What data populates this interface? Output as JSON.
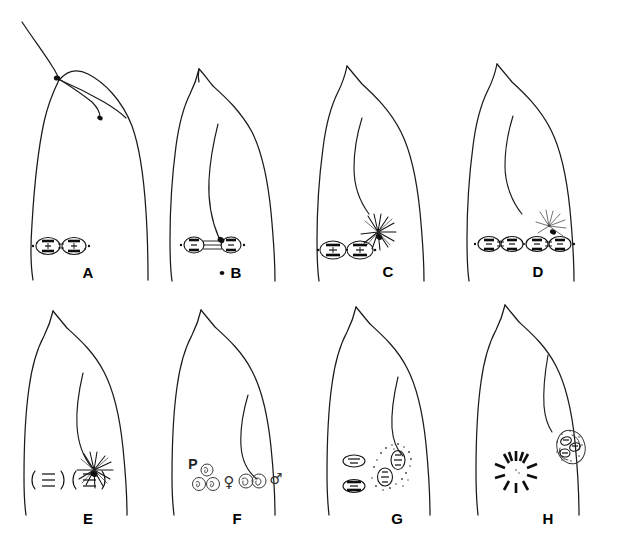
{
  "figure": {
    "background_color": "#ffffff",
    "ink_color": "#111111",
    "width": 639,
    "height": 544,
    "rows": 2,
    "columns": 4
  },
  "panels": [
    {
      "id": "A",
      "label": "A",
      "label_x": 88,
      "label_y": 278,
      "row": 1,
      "column": 1,
      "description": "Egg with fertilization cone at apex; sperm entry point marked by dark spot with sperm tail trailing to the right; metaphase spindle with chromosomes at the base.",
      "features": [
        "fertilization-cone",
        "sperm-entry-spot",
        "sperm-tail",
        "metaphase-spindle"
      ],
      "aster_count": 0,
      "spindle_count": 1
    },
    {
      "id": "B",
      "label": "B",
      "label_x": 236,
      "label_y": 278,
      "row": 1,
      "column": 2,
      "description": "Egg with smooth apex; sperm tail curving down inside cytoplasm ending in dark sperm head; anaphase spindle with separated chromosomes joined by fibers.",
      "features": [
        "apex-cone",
        "sperm-tail",
        "sperm-head",
        "anaphase-spindle"
      ],
      "aster_count": 0,
      "spindle_count": 1,
      "marker_dot": true
    },
    {
      "id": "C",
      "label": "C",
      "label_x": 388,
      "label_y": 277,
      "row": 1,
      "column": 3,
      "description": "Egg with sperm tail; sperm aster (radiating rays around dark sperm nucleus) near lower right; two daughter spindles abutting at the base.",
      "features": [
        "sperm-tail",
        "sperm-aster",
        "paired-spindles"
      ],
      "aster_count": 1,
      "spindle_count": 2
    },
    {
      "id": "D",
      "label": "D",
      "label_x": 538,
      "label_y": 277,
      "row": 1,
      "column": 4,
      "description": "Egg with sperm tail; small sperm aster at right; four chromosome groups in two adjacent spindles along the base.",
      "features": [
        "sperm-tail",
        "sperm-aster",
        "four-group-spindles"
      ],
      "aster_count": 1,
      "spindle_count": 2
    },
    {
      "id": "E",
      "label": "E",
      "label_x": 88,
      "label_y": 524,
      "row": 2,
      "column": 1,
      "description": "Egg with sperm tail; sperm aster with dark sperm nucleus at centre; two polar-body nuclei drawn as bracketed bodies with three chromatin bars.",
      "features": [
        "sperm-tail",
        "sperm-aster",
        "polar-body-nuclei"
      ],
      "aster_count": 1,
      "nuclei_count": 2
    },
    {
      "id": "F",
      "label": "F",
      "label_x": 237,
      "label_y": 524,
      "row": 2,
      "column": 2,
      "description": "Egg with sperm tail; three polar bodies labelled P at lower left; female and male pronuclei in contact flanked by the female and male symbols.",
      "features": [
        "sperm-tail",
        "polar-bodies",
        "female-pronucleus",
        "male-pronucleus"
      ],
      "polar_body_label": "P",
      "female_symbol": "♀",
      "male_symbol": "♂",
      "polar_body_count": 3,
      "pronuclei_count": 2
    },
    {
      "id": "G",
      "label": "G",
      "label_x": 397,
      "label_y": 524,
      "row": 2,
      "column": 3,
      "description": "Egg with sperm tail; two polar-body nuclei at left; paired pronuclei in a stippled cytoplasmic cloud at right.",
      "features": [
        "sperm-tail",
        "polar-body-nuclei",
        "paired-pronuclei",
        "cytoplasmic-stippling"
      ],
      "nuclei_count": 2,
      "pronuclei_count": 2
    },
    {
      "id": "H",
      "label": "H",
      "label_x": 548,
      "label_y": 524,
      "row": 2,
      "column": 4,
      "description": "Egg with sperm tail; radial rosette of chromosomes at lower left; clustered chromosome group in a stippled mass at right.",
      "features": [
        "sperm-tail",
        "chromosome-rosette",
        "chromosome-cluster"
      ],
      "rosette_segments": 12
    }
  ]
}
